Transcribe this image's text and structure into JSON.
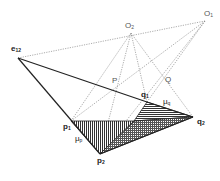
{
  "diagram": {
    "type": "geometric-construction",
    "colors": {
      "line": "#222222",
      "dotted": "#888888",
      "hatch": "#333333",
      "background": "#ffffff"
    },
    "points": {
      "e12": {
        "label": "e",
        "sub": "12",
        "x": 18,
        "y": 58
      },
      "O1": {
        "label": "O",
        "sub": "1",
        "x": 205,
        "y": 21
      },
      "O2": {
        "label": "O",
        "sub": "2",
        "x": 131,
        "y": 33
      },
      "P": {
        "label": "P",
        "x": 117,
        "y": 88
      },
      "Q": {
        "label": "Q",
        "x": 163,
        "y": 87
      },
      "p1": {
        "label": "p",
        "sub": "1",
        "x": 71,
        "y": 121
      },
      "p2": {
        "label": "p",
        "sub": "2",
        "x": 100,
        "y": 154
      },
      "q1": {
        "label": "q",
        "sub": "1",
        "x": 147,
        "y": 102
      },
      "q2": {
        "label": "q",
        "sub": "2",
        "x": 193,
        "y": 117
      }
    },
    "annotations": {
      "mu_p": {
        "label": "μ",
        "sub": "p"
      },
      "mu_q": {
        "label": "μ",
        "sub": "q"
      }
    }
  }
}
